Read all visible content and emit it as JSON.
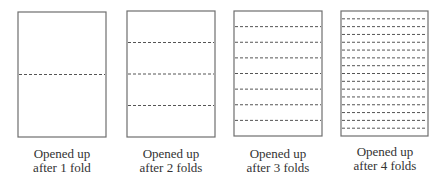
{
  "diagram": {
    "panels": [
      {
        "folds": 1,
        "caption_line1": "Opened up",
        "caption_line2": "after 1 fold"
      },
      {
        "folds": 2,
        "caption_line1": "Opened up",
        "caption_line2": "after 2 folds"
      },
      {
        "folds": 3,
        "caption_line1": "Opened up",
        "caption_line2": "after 3 folds"
      },
      {
        "folds": 4,
        "caption_line1": "Opened up",
        "caption_line2": "after 4 folds"
      }
    ],
    "colors": {
      "border": "#6e6e6e",
      "fold_line": "#555555",
      "text": "#333333"
    }
  }
}
